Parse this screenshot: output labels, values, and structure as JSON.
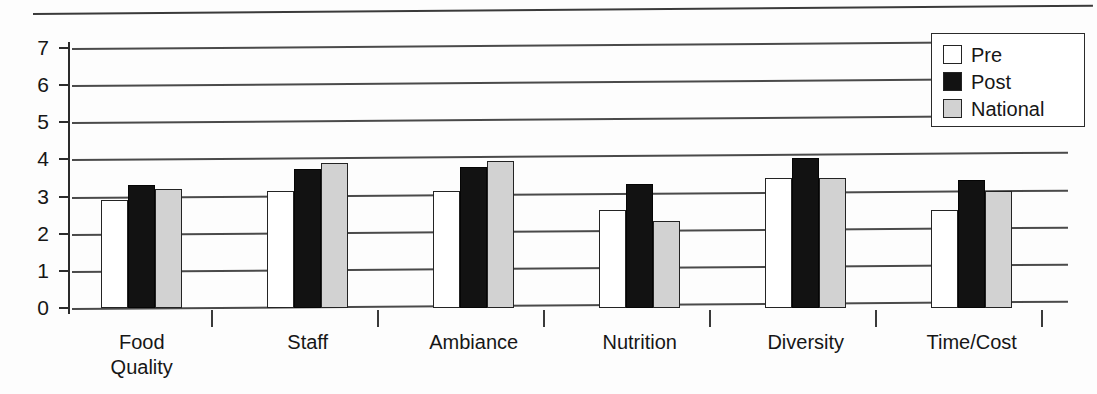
{
  "chart_data": {
    "type": "bar",
    "title": "",
    "subtitle": "",
    "xlabel": "",
    "ylabel": "",
    "ylim": [
      0,
      7
    ],
    "y_ticks": [
      "0",
      "1",
      "2",
      "3",
      "4",
      "5",
      "6",
      "7"
    ],
    "grid": true,
    "legend_position": "top-right",
    "categories": [
      "Food\nQuality",
      "Staff",
      "Ambiance",
      "Nutrition",
      "Diversity",
      "Time/Cost"
    ],
    "series": [
      {
        "name": "Pre",
        "color": "#ffffff",
        "values": [
          2.9,
          3.15,
          3.15,
          2.65,
          3.5,
          2.65
        ]
      },
      {
        "name": "Post",
        "color": "#121212",
        "values": [
          3.3,
          3.75,
          3.8,
          3.35,
          4.05,
          3.45
        ]
      },
      {
        "name": "National",
        "color": "#d2d2d2",
        "values": [
          3.2,
          3.9,
          3.95,
          2.35,
          3.5,
          3.15
        ]
      }
    ]
  },
  "legend": {
    "items": [
      {
        "label": "Pre",
        "swatch": "pre"
      },
      {
        "label": "Post",
        "swatch": "post"
      },
      {
        "label": "National",
        "swatch": "national"
      }
    ]
  },
  "colors": {
    "pre": "#ffffff",
    "post": "#121212",
    "national": "#d2d2d2",
    "axis": "#2b2b2b",
    "grid": "#4a4a4a"
  }
}
